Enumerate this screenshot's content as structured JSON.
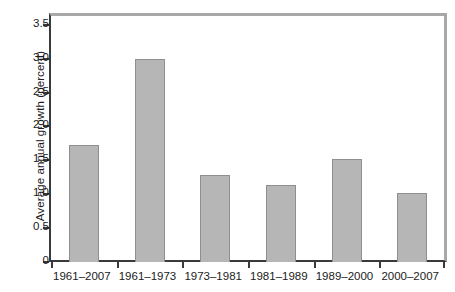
{
  "chart_data": {
    "type": "bar",
    "title": "",
    "xlabel": "",
    "ylabel": "Average annual growth (percent)",
    "categories": [
      "1961–2007",
      "1961–1973",
      "1973–1981",
      "1981–1989",
      "1989–2000",
      "2000–2007"
    ],
    "values": [
      1.73,
      3.0,
      1.28,
      1.14,
      1.52,
      1.02
    ],
    "ylim": [
      0,
      3.63
    ],
    "yticks": [
      0,
      0.5,
      1.0,
      1.5,
      2.0,
      2.5,
      3.0,
      3.5
    ],
    "ytick_labels": [
      "0",
      "0.5",
      "1.0",
      "1.5",
      "2.0",
      "2.5",
      "3.0",
      "3.5"
    ],
    "grid": false,
    "legend": null,
    "bar_color": "#b6b6b6",
    "bar_edge_color": "#8f8f8f",
    "axis_color": "#3a3a3a",
    "frame_color": "#a8a8a8"
  }
}
